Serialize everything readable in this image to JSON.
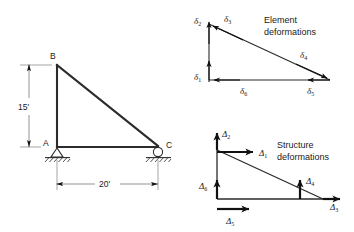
{
  "figure": {
    "background_color": "#ffffff",
    "line_color": "#2b2b2b"
  },
  "truss": {
    "name": "right-triangle-truss",
    "nodes": [
      {
        "id": "B",
        "label": "B",
        "position": "apex-top-left"
      },
      {
        "id": "A",
        "label": "A",
        "position": "base-left",
        "support": "pin"
      },
      {
        "id": "C",
        "label": "C",
        "position": "base-right",
        "support": "roller"
      }
    ],
    "dimensions": [
      {
        "id": "height",
        "label": "15'",
        "orientation": "vertical",
        "from": "A",
        "to": "B"
      },
      {
        "id": "span",
        "label": "20'",
        "orientation": "horizontal",
        "from": "A",
        "to": "C"
      }
    ],
    "supports": {
      "pin_label": "pin-support",
      "roller_label": "roller-support"
    }
  },
  "element_deformations": {
    "caption_line1": "Element",
    "caption_line2": "deformations",
    "symbol": "δ",
    "arrows": [
      {
        "id": "d1",
        "symbol": "δ",
        "subscript": "1",
        "direction": "up",
        "location": "bottom-left-vertical-member",
        "style": "thin"
      },
      {
        "id": "d2",
        "symbol": "δ",
        "subscript": "2",
        "direction": "up",
        "location": "top-left-vertical-member",
        "style": "thin"
      },
      {
        "id": "d3",
        "symbol": "δ",
        "subscript": "3",
        "direction": "down-left-along-diagonal",
        "location": "diagonal-upper",
        "style": "thin"
      },
      {
        "id": "d4",
        "symbol": "δ",
        "subscript": "4",
        "direction": "down-right-along-diagonal",
        "location": "diagonal-lower",
        "style": "thin"
      },
      {
        "id": "d5",
        "symbol": "δ",
        "subscript": "5",
        "direction": "left",
        "location": "bottom-right-horizontal-member",
        "style": "thin"
      },
      {
        "id": "d6",
        "symbol": "δ",
        "subscript": "6",
        "direction": "left",
        "location": "bottom-left-horizontal-member",
        "style": "thin"
      }
    ]
  },
  "structure_deformations": {
    "caption_line1": "Structure",
    "caption_line2": "deformations",
    "symbol": "Δ",
    "arrows": [
      {
        "id": "D1",
        "symbol": "Δ",
        "subscript": "1",
        "direction": "right",
        "location": "apex-horizontal",
        "style": "bold"
      },
      {
        "id": "D2",
        "symbol": "Δ",
        "subscript": "2",
        "direction": "up",
        "location": "apex-vertical",
        "style": "bold"
      },
      {
        "id": "D3",
        "symbol": "Δ",
        "subscript": "3",
        "direction": "right",
        "location": "base-right-horizontal",
        "style": "bold"
      },
      {
        "id": "D4",
        "symbol": "Δ",
        "subscript": "4",
        "direction": "up",
        "location": "base-right-vertical",
        "style": "bold"
      },
      {
        "id": "D5",
        "symbol": "Δ",
        "subscript": "5",
        "direction": "right",
        "location": "base-left-horizontal",
        "style": "bold"
      },
      {
        "id": "D6",
        "symbol": "Δ",
        "subscript": "6",
        "direction": "up",
        "location": "base-left-vertical",
        "style": "bold"
      }
    ]
  }
}
